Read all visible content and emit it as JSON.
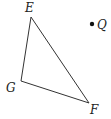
{
  "diagram": {
    "type": "geometry",
    "stroke_color": "#333333",
    "triangle": {
      "name": "EFG",
      "vertices": [
        {
          "label": "E",
          "x": 31,
          "y": 17,
          "label_x": 25,
          "label_y": 12
        },
        {
          "label": "G",
          "x": 21,
          "y": 81,
          "label_x": 6,
          "label_y": 92
        },
        {
          "label": "F",
          "x": 89,
          "y": 103,
          "label_x": 90,
          "label_y": 114
        }
      ]
    },
    "point": {
      "label": "Q",
      "x": 92,
      "y": 24,
      "label_x": 97,
      "label_y": 29
    }
  }
}
